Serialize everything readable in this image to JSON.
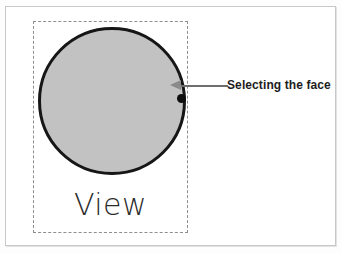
{
  "figure": {
    "type": "technical-illustration",
    "background_color": "#ffffff",
    "frame": {
      "name": "figure-border",
      "color": "#c8c8c8"
    },
    "viewport": {
      "name": "view-boundary",
      "style": "dashed",
      "color": "#8e8e8e",
      "caption": "View"
    },
    "shape": {
      "name": "circular-face",
      "kind": "circle",
      "fill_color": "#c2c2c2",
      "stroke_color": "#161616"
    },
    "selection": {
      "marker_name": "selection-point",
      "marker_color": "#0d0d0d",
      "arrow_color": "#8a8a8a",
      "leader_color": "#6e6e6e"
    },
    "callout": {
      "label": "Selecting the face",
      "text_color": "#1d1d1d"
    }
  }
}
